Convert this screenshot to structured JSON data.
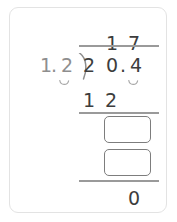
{
  "widget": {
    "type": "long-division-worksheet",
    "border_color": "#e3e3e3",
    "ink_color": "#3d3d3d",
    "rule_color": "#9a9a9a",
    "box_border_color": "#7d7d7d"
  },
  "problem": {
    "divisor": "1.2",
    "dividend": "20.4",
    "quotient": "17",
    "statement": "20.4 ÷ 1.2 = 17"
  },
  "quotient": {
    "digit_1": "1",
    "digit_2": "7"
  },
  "divisor": {
    "digit_1": "1",
    "decimal_point": ".",
    "digit_2": "2",
    "shift_caret": "decimal-shift-caret"
  },
  "dividend": {
    "digit_1": "2",
    "digit_2": "0",
    "decimal_point": ".",
    "digit_3": "4",
    "shift_caret": "decimal-shift-caret"
  },
  "work": {
    "partial_product": "12",
    "partial_product_digit_1": "1",
    "partial_product_digit_2": "2",
    "remainder_final": "0"
  },
  "answer_boxes": [
    {
      "id": "answer-box-1",
      "value": "",
      "placeholder": ""
    },
    {
      "id": "answer-box-2",
      "value": "",
      "placeholder": ""
    }
  ],
  "icons": {
    "division_bracket": "division-bracket-icon",
    "caret": "caret-icon"
  }
}
